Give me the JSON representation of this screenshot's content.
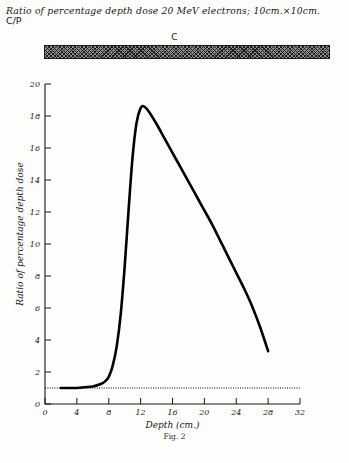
{
  "figure": {
    "title_line1": "Ratio of percentage depth dose 20 MeV electrons; 10cm.×10cm.",
    "title_line2": "C/P",
    "slab_label": "C",
    "caption": "Fig. 2"
  },
  "chart_data": {
    "type": "line",
    "title": "Ratio of percentage depth dose 20 MeV electrons; 10cm.×10cm. C/P",
    "xlabel": "Depth (cm.)",
    "ylabel": "Ratio of percentage depth dose",
    "xlim": [
      0,
      32
    ],
    "ylim": [
      0,
      20
    ],
    "xticks": [
      0,
      4,
      8,
      12,
      16,
      20,
      24,
      28,
      32
    ],
    "yticks": [
      0,
      2,
      4,
      6,
      8,
      10,
      12,
      14,
      16,
      18,
      20
    ],
    "grid": false,
    "legend": null,
    "series": [
      {
        "name": "C/P ratio",
        "style": "solid-thick",
        "x": [
          2.0,
          3.0,
          4.0,
          5.0,
          6.0,
          7.0,
          7.5,
          8.0,
          8.5,
          9.0,
          9.5,
          10.0,
          10.5,
          11.0,
          11.5,
          12.0,
          12.4,
          13.0,
          14.0,
          15.0,
          16.0,
          17.0,
          18.0,
          19.0,
          20.0,
          21.0,
          22.0,
          23.0,
          24.0,
          25.0,
          26.0,
          27.0,
          28.0
        ],
        "y": [
          1.0,
          1.0,
          1.0,
          1.05,
          1.1,
          1.25,
          1.4,
          1.7,
          2.4,
          3.6,
          5.6,
          8.6,
          12.2,
          15.5,
          17.6,
          18.5,
          18.6,
          18.3,
          17.5,
          16.6,
          15.7,
          14.8,
          13.9,
          13.0,
          12.1,
          11.2,
          10.2,
          9.2,
          8.2,
          7.2,
          6.1,
          4.8,
          3.3
        ]
      },
      {
        "name": "unity reference",
        "style": "dotted",
        "x": [
          0,
          32
        ],
        "y": [
          1.0,
          1.0
        ]
      }
    ],
    "annotations": [
      {
        "text": "C",
        "note": "hatched slab above plot spanning full depth axis"
      }
    ]
  }
}
